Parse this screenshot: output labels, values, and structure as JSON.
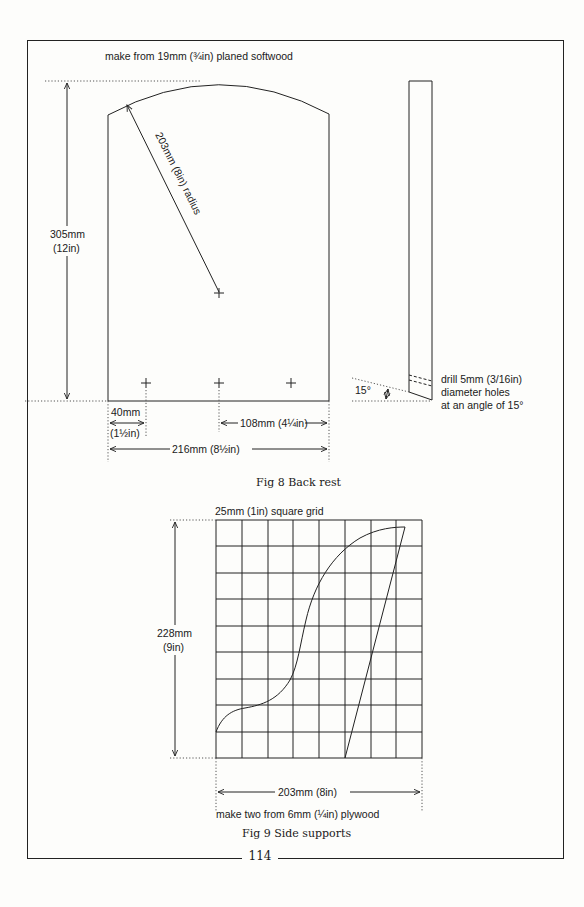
{
  "page": {
    "page_number": "114"
  },
  "fig8": {
    "caption": "Fig 8 Back rest",
    "material_note": "make from 19mm (¾in) planed softwood",
    "height_mm": "305mm",
    "height_in": "(12in)",
    "radius_label": "203mm (8in) radius",
    "left_offset_mm": "40mm",
    "left_offset_in": "(1½in)",
    "half_width_label": "108mm (4¼in)",
    "width_label": "216mm (8½in)",
    "angle_label": "15°",
    "drill_note": [
      "drill 5mm (3/16in)",
      "diameter holes",
      "at an angle of 15°"
    ]
  },
  "fig9": {
    "caption": "Fig 9 Side supports",
    "grid_note": "25mm (1in) square grid",
    "height_mm": "228mm",
    "height_in": "(9in)",
    "width_label": "203mm (8in)",
    "material_note": "make two from 6mm (¼in) plywood",
    "grid_columns": 8,
    "grid_rows": 9
  }
}
